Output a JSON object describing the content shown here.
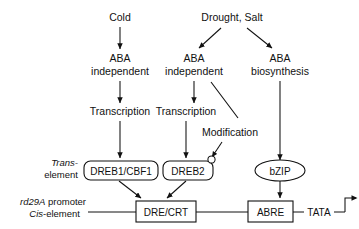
{
  "diagram": {
    "stimuli": {
      "cold": "Cold",
      "drought_salt": "Drought, Salt"
    },
    "pathways": {
      "aba_independent_cold_line1": "ABA",
      "aba_independent_cold_line2": "independent",
      "aba_independent_drought_line1": "ABA",
      "aba_independent_drought_line2": "independent",
      "aba_biosynthesis_line1": "ABA",
      "aba_biosynthesis_line2": "biosynthesis"
    },
    "processes": {
      "transcription_left": "Transcription",
      "transcription_middle": "Transcription",
      "modification": "Modification"
    },
    "row_labels": {
      "trans_element_line1": "Trans-",
      "trans_element_line2": "element",
      "cis_element_line1_italic": "rd29A",
      "cis_element_line1_rest": " promoter",
      "cis_element_line2_italic": "Cis",
      "cis_element_line2_rest": "-element"
    },
    "trans_factors": [
      {
        "id": "dreb1",
        "label": "DREB1/CBF1",
        "shape": "rounded-rect"
      },
      {
        "id": "dreb2",
        "label": "DREB2",
        "shape": "rounded-rect"
      },
      {
        "id": "bzip",
        "label": "bZIP",
        "shape": "ellipse"
      }
    ],
    "cis_elements": [
      {
        "id": "dre-crt",
        "label": "DRE/CRT",
        "shape": "rect"
      },
      {
        "id": "abre",
        "label": "ABRE",
        "shape": "rect"
      }
    ],
    "core_promoter": {
      "label": "TATA",
      "start_arrow": "transcription-start-bent-arrow"
    },
    "colors": {
      "background": "#ffffff",
      "stroke": "#111111",
      "text": "#111111"
    }
  }
}
